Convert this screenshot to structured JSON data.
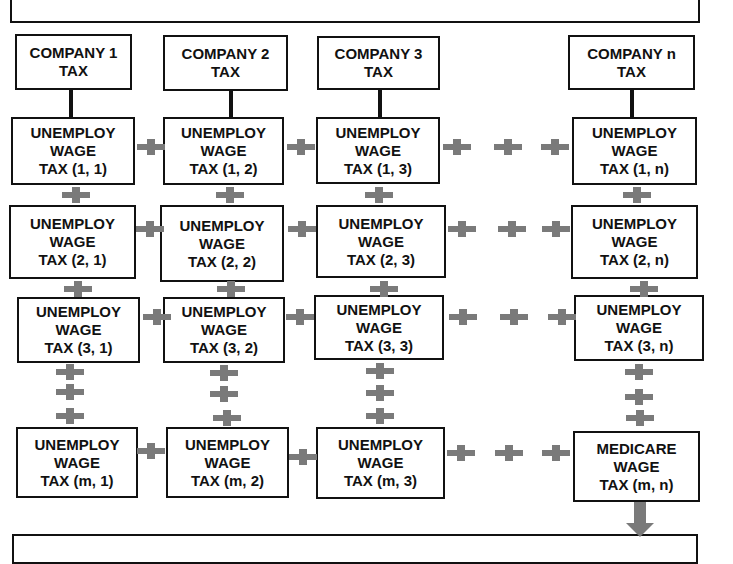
{
  "diagram": {
    "companies": [
      {
        "line1": "COMPANY 1",
        "line2": "TAX"
      },
      {
        "line1": "COMPANY 2",
        "line2": "TAX"
      },
      {
        "line1": "COMPANY 3",
        "line2": "TAX"
      },
      {
        "line1": "COMPANY n",
        "line2": "TAX"
      }
    ],
    "cells": {
      "r1": [
        {
          "l1": "UNEMPLOY",
          "l2": "WAGE",
          "l3": "TAX (1, 1)"
        },
        {
          "l1": "UNEMPLOY",
          "l2": "WAGE",
          "l3": "TAX (1, 2)"
        },
        {
          "l1": "UNEMPLOY",
          "l2": "WAGE",
          "l3": "TAX (1, 3)"
        },
        {
          "l1": "UNEMPLOY",
          "l2": "WAGE",
          "l3": "TAX (1, n)"
        }
      ],
      "r2": [
        {
          "l1": "UNEMPLOY",
          "l2": "WAGE",
          "l3": "TAX (2, 1)"
        },
        {
          "l1": "UNEMPLOY",
          "l2": "WAGE",
          "l3": "TAX (2, 2)"
        },
        {
          "l1": "UNEMPLOY",
          "l2": "WAGE",
          "l3": "TAX (2, 3)"
        },
        {
          "l1": "UNEMPLOY",
          "l2": "WAGE",
          "l3": "TAX (2, n)"
        }
      ],
      "r3": [
        {
          "l1": "UNEMPLOY",
          "l2": "WAGE",
          "l3": "TAX (3, 1)"
        },
        {
          "l1": "UNEMPLOY",
          "l2": "WAGE",
          "l3": "TAX (3, 2)"
        },
        {
          "l1": "UNEMPLOY",
          "l2": "WAGE",
          "l3": "TAX (3, 3)"
        },
        {
          "l1": "UNEMPLOY",
          "l2": "WAGE",
          "l3": "TAX (3, n)"
        }
      ],
      "rm": [
        {
          "l1": "UNEMPLOY",
          "l2": "WAGE",
          "l3": "TAX (m, 1)"
        },
        {
          "l1": "UNEMPLOY",
          "l2": "WAGE",
          "l3": "TAX (m, 2)"
        },
        {
          "l1": "UNEMPLOY",
          "l2": "WAGE",
          "l3": "TAX (m, 3)"
        },
        {
          "l1": "MEDICARE",
          "l2": "WAGE",
          "l3": "TAX (m, n)"
        }
      ]
    },
    "connector_icon": "plus-icon",
    "output_icon": "arrow-down-icon",
    "colors": {
      "border": "#111111",
      "connector": "#7a7a7a",
      "background": "#ffffff"
    }
  }
}
